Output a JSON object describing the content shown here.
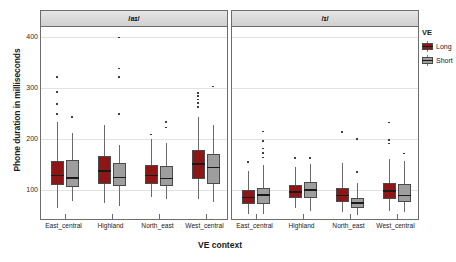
{
  "chart_data": {
    "type": "box",
    "title": "",
    "xlabel": "VE context",
    "ylabel": "Phone duration in milliseconds",
    "ylim": [
      40,
      420
    ],
    "yticks": [
      100,
      200,
      300,
      400
    ],
    "grid": true,
    "legend": {
      "title": "VE",
      "position": "right",
      "entries": [
        {
          "label": "Long",
          "color": "#8e1616"
        },
        {
          "label": "Short",
          "color": "#9e9e9e"
        }
      ]
    },
    "panels": [
      {
        "label": "/aɪ/",
        "categories": [
          "East_central",
          "Highland",
          "North_east",
          "West_central"
        ],
        "series": [
          {
            "name": "Long",
            "color": "#8e1616",
            "boxes": [
              {
                "category": "East_central",
                "whisker_low": 63,
                "q1": 108,
                "median": 128,
                "q3": 157,
                "whisker_high": 232,
                "outliers": [
                  249,
                  268,
                  292,
                  322
                ]
              },
              {
                "category": "Highland",
                "whisker_low": 73,
                "q1": 110,
                "median": 136,
                "q3": 166,
                "whisker_high": 228,
                "outliers": []
              },
              {
                "category": "North_east",
                "whisker_low": 86,
                "q1": 110,
                "median": 128,
                "q3": 148,
                "whisker_high": 199,
                "outliers": [
                  208
                ]
              },
              {
                "category": "West_central",
                "whisker_low": 82,
                "q1": 121,
                "median": 150,
                "q3": 178,
                "whisker_high": 243,
                "outliers": [
                  262,
                  270,
                  277,
                  284,
                  290
                ]
              }
            ]
          },
          {
            "name": "Short",
            "color": "#9e9e9e",
            "boxes": [
              {
                "category": "East_central",
                "whisker_low": 77,
                "q1": 104,
                "median": 123,
                "q3": 158,
                "whisker_high": 212,
                "outliers": [
                  243
                ]
              },
              {
                "category": "Highland",
                "whisker_low": 68,
                "q1": 106,
                "median": 124,
                "q3": 152,
                "whisker_high": 188,
                "outliers": [
                  249,
                  322,
                  338,
                  399
                ]
              },
              {
                "category": "North_east",
                "whisker_low": 82,
                "q1": 106,
                "median": 122,
                "q3": 146,
                "whisker_high": 192,
                "outliers": [
                  222,
                  233
                ]
              },
              {
                "category": "West_central",
                "whisker_low": 75,
                "q1": 110,
                "median": 143,
                "q3": 170,
                "whisker_high": 228,
                "outliers": [
                  303
                ]
              }
            ]
          }
        ]
      },
      {
        "label": "/ɪ/",
        "categories": [
          "East_central",
          "Highland",
          "North_east",
          "West_central"
        ],
        "series": [
          {
            "name": "Long",
            "color": "#8e1616",
            "boxes": [
              {
                "category": "East_central",
                "whisker_low": 52,
                "q1": 71,
                "median": 84,
                "q3": 99,
                "whisker_high": 137,
                "outliers": [
                  154
                ]
              },
              {
                "category": "Highland",
                "whisker_low": 63,
                "q1": 84,
                "median": 95,
                "q3": 108,
                "whisker_high": 145,
                "outliers": [
                  162
                ]
              },
              {
                "category": "North_east",
                "whisker_low": 56,
                "q1": 76,
                "median": 88,
                "q3": 103,
                "whisker_high": 152,
                "outliers": [
                  213
                ]
              },
              {
                "category": "West_central",
                "whisker_low": 57,
                "q1": 82,
                "median": 97,
                "q3": 112,
                "whisker_high": 160,
                "outliers": [
                  191,
                  197,
                  232
                ]
              }
            ]
          },
          {
            "name": "Short",
            "color": "#9e9e9e",
            "boxes": [
              {
                "category": "East_central",
                "whisker_low": 52,
                "q1": 72,
                "median": 89,
                "q3": 103,
                "whisker_high": 148,
                "outliers": [
                  163,
                  172,
                  181,
                  196,
                  214
                ]
              },
              {
                "category": "Highland",
                "whisker_low": 58,
                "q1": 83,
                "median": 99,
                "q3": 114,
                "whisker_high": 150,
                "outliers": [
                  162
                ]
              },
              {
                "category": "North_east",
                "whisker_low": 50,
                "q1": 63,
                "median": 73,
                "q3": 84,
                "whisker_high": 113,
                "outliers": [
                  135,
                  200
                ]
              },
              {
                "category": "West_central",
                "whisker_low": 55,
                "q1": 76,
                "median": 88,
                "q3": 111,
                "whisker_high": 156,
                "outliers": [
                  171
                ]
              }
            ]
          }
        ]
      }
    ]
  }
}
